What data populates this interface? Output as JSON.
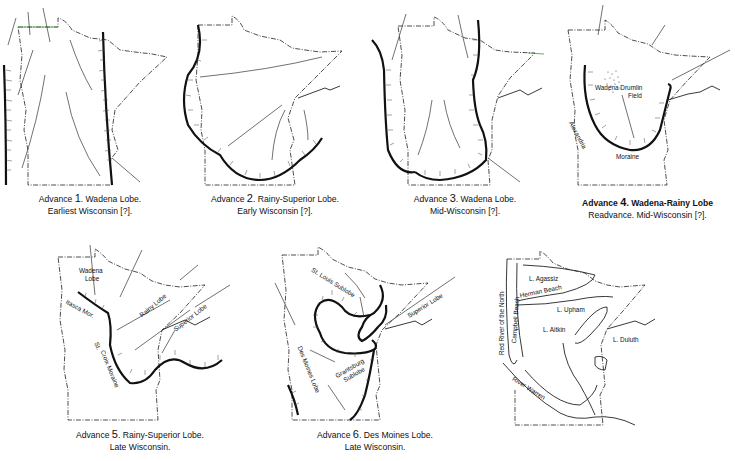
{
  "figure": {
    "panels": [
      {
        "id": 1,
        "prefix": "Advance ",
        "number": "1",
        "line1": ". Wadena Lobe.",
        "line2": "Earliest Wisconsin [?]."
      },
      {
        "id": 2,
        "prefix": "Advance ",
        "number": "2",
        "line1": ". Rainy-Superior Lobe.",
        "line2": "Early Wisconsin [?]."
      },
      {
        "id": 3,
        "prefix": "Advance ",
        "number": "3",
        "line1": ". Wadena Lobe.",
        "line2": "Mid-Wisconsin [?]."
      },
      {
        "id": 4,
        "prefix": "Advance ",
        "number": "4",
        "line1": ". Wadena-Rainy Lobe",
        "line2": "Readvance. Mid-Wisconsin [?].",
        "labels": {
          "drumlin1": "Wadena Drumlin",
          "drumlin2": "Field",
          "alexandria": "Alexandria",
          "moraine": "Moraine"
        }
      },
      {
        "id": 5,
        "prefix": "Advance ",
        "number": "5",
        "line1": ". Rainy-Superior Lobe.",
        "line2": "Late Wisconsin.",
        "labels": {
          "wadena1": "Wadena",
          "wadena2": "Lobe",
          "itasca": "Itasca Mor.",
          "rainy": "Rainy Lobe",
          "superior": "Superior Lobe",
          "stcroix1": "St.",
          "stcroix2": "Croix Moraine"
        }
      },
      {
        "id": 6,
        "prefix": "Advance ",
        "number": "6",
        "line1": ". Des Moines Lobe.",
        "line2": "Late Wisconsin.",
        "labels": {
          "stlouis": "St. Louis Sublobe",
          "superior": "Superior Lobe",
          "grantsburg1": "Grantsburg",
          "grantsburg2": "Sublobe",
          "desmoines": "Des Moines Lobe"
        }
      },
      {
        "id": 7,
        "labels": {
          "redriver": "Red River of the North",
          "campbell": "Campbell Beach",
          "herman": "Herman Beach",
          "agassiz": "L. Agassiz",
          "upham": "L. Upham",
          "aitkin": "L. Aitkin",
          "duluth": "L. Duluth",
          "warren": "River Warren"
        }
      }
    ],
    "colors": {
      "ink": "#111111",
      "border_accent": "#3a9a3a",
      "background": "#ffffff"
    }
  }
}
